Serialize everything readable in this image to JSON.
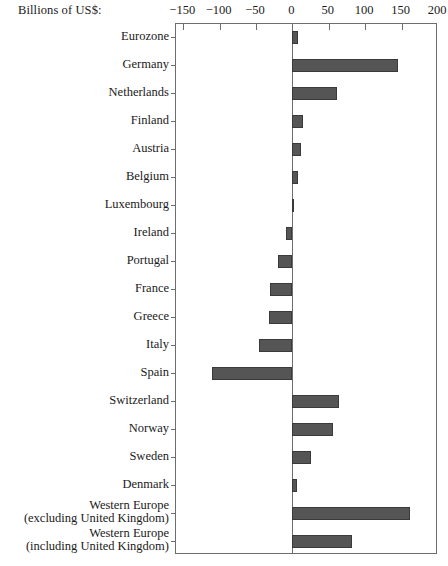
{
  "chart_data": {
    "type": "bar",
    "orientation": "horizontal",
    "title": "",
    "axis_caption": "Billions of US$:",
    "xlabel": "Billions of US$",
    "ylabel": "",
    "xlim": [
      -160,
      200
    ],
    "xticks": [
      -150,
      -100,
      -50,
      0,
      50,
      100,
      150,
      200
    ],
    "xtick_labels": [
      "−150",
      "−100",
      "−50",
      "0",
      "50",
      "100",
      "150",
      "200"
    ],
    "grid": false,
    "legend": "none",
    "zero_reference_line": true,
    "bar_color": "#555555",
    "bar_edge_color": "#3a3a3a",
    "frame_color": "#6d6d6d",
    "categories": [
      "Eurozone",
      "Germany",
      "Netherlands",
      "Finland",
      "Austria",
      "Belgium",
      "Luxembourg",
      "Ireland",
      "Portugal",
      "France",
      "Greece",
      "Italy",
      "Spain",
      "Switzerland",
      "Norway",
      "Sweden",
      "Denmark",
      "Western Europe (excluding United Kingdom)",
      "Western Europe (including United Kingdom)"
    ],
    "values": [
      7,
      145,
      61,
      14,
      12,
      8,
      2,
      -9,
      -20,
      -31,
      -32,
      -46,
      -110,
      64,
      56,
      25,
      6,
      161,
      82
    ]
  },
  "labels": [
    {
      "line1": "Eurozone",
      "line2": ""
    },
    {
      "line1": "Germany",
      "line2": ""
    },
    {
      "line1": "Netherlands",
      "line2": ""
    },
    {
      "line1": "Finland",
      "line2": ""
    },
    {
      "line1": "Austria",
      "line2": ""
    },
    {
      "line1": "Belgium",
      "line2": ""
    },
    {
      "line1": "Luxembourg",
      "line2": ""
    },
    {
      "line1": "Ireland",
      "line2": ""
    },
    {
      "line1": "Portugal",
      "line2": ""
    },
    {
      "line1": "France",
      "line2": ""
    },
    {
      "line1": "Greece",
      "line2": ""
    },
    {
      "line1": "Italy",
      "line2": ""
    },
    {
      "line1": "Spain",
      "line2": ""
    },
    {
      "line1": "Switzerland",
      "line2": ""
    },
    {
      "line1": "Norway",
      "line2": ""
    },
    {
      "line1": "Sweden",
      "line2": ""
    },
    {
      "line1": "Denmark",
      "line2": ""
    },
    {
      "line1": "Western Europe",
      "line2": "(excluding United Kingdom)"
    },
    {
      "line1": "Western Europe",
      "line2": "(including United Kingdom)"
    }
  ]
}
